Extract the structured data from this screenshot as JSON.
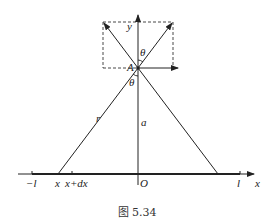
{
  "figure": {
    "caption": "图 5.34",
    "labels": {
      "y_axis": "y",
      "x_axis": "x",
      "point_A": "A",
      "theta_top": "θ",
      "theta_bottom": "θ",
      "r": "r",
      "a": "a",
      "origin": "O",
      "neg_l": "−l",
      "pos_l": "l",
      "x": "x",
      "x_dx": "x+dx"
    }
  }
}
